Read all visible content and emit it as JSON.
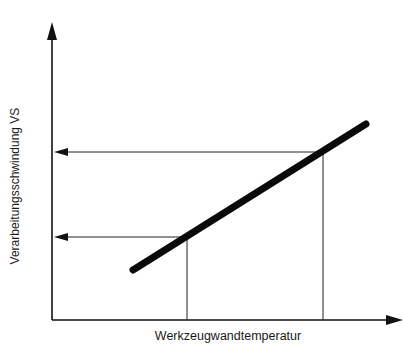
{
  "diagram": {
    "x_axis_label": "Werkzeugwandtemperatur",
    "y_axis_label": "Verarbeitungsschwindung VS",
    "colors": {
      "background": "#ffffff",
      "lines": "#111111",
      "text": "#1a1a1a"
    },
    "geometry": {
      "origin": [
        52,
        320
      ],
      "y_axis_top": [
        52,
        25
      ],
      "x_axis_end": [
        401,
        320
      ],
      "trend_line": {
        "start": [
          133,
          270
        ],
        "end": [
          366,
          124
        ]
      },
      "readouts": [
        {
          "name": "lower",
          "x": 187,
          "y": 237
        },
        {
          "name": "upper",
          "x": 323,
          "y": 152
        }
      ]
    },
    "relationship": "Verarbeitungsschwindung increases linearly with Werkzeugwandtemperatur"
  }
}
